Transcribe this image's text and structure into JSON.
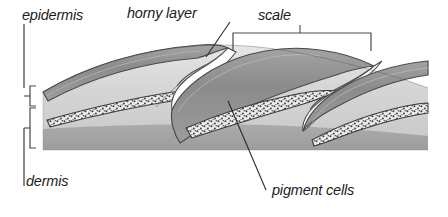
{
  "figure": {
    "width": 448,
    "height": 217
  },
  "labels": {
    "epidermis": "epidermis",
    "horny_layer": "horny layer",
    "scale": "scale",
    "dermis": "dermis",
    "pigment_cells": "pigment cells"
  },
  "colors": {
    "background": "#ffffff",
    "outline": "#3a3a3a",
    "leader_line": "#2b2b2b",
    "bracket": "#4a4a4a",
    "horny_layer_fill": "#8e8e8e",
    "horny_layer_dark": "#7a7a7a",
    "epidermis_fill": "#d2d2d2",
    "epidermis_light": "#e2e2e2",
    "dermis_fill": "#a8a8a8",
    "pigment_band_fill": "#e8e8e8",
    "pigment_speckle": "#3c3c3c",
    "gap_white": "#ffffff",
    "text": "#1b1b1b"
  },
  "structures": [
    {
      "name": "horny-layer",
      "description": "Dark keratinized outer band forming the upper surface of each scale",
      "label_ref": "horny_layer"
    },
    {
      "name": "epidermis",
      "description": "Light grey cellular layer beneath the horny layer, bracketed at left",
      "label_ref": "epidermis"
    },
    {
      "name": "dermis",
      "description": "Medium grey basal band at the bottom of the section",
      "label_ref": "dermis"
    },
    {
      "name": "pigment-cells",
      "description": "Speckled lens-shaped bands of pigment cells within each scale",
      "label_ref": "pigment_cells"
    },
    {
      "name": "scale",
      "description": "One complete overlapping scale unit spanned by the top bracket",
      "label_ref": "scale"
    }
  ],
  "annotations": {
    "brackets": [
      {
        "name": "epidermis-bracket",
        "orientation": "vertical-left",
        "spans": "epidermis"
      },
      {
        "name": "dermis-bracket",
        "orientation": "vertical-left",
        "spans": "dermis"
      },
      {
        "name": "scale-bracket",
        "orientation": "horizontal-top",
        "spans": "scale"
      }
    ],
    "leader_lines": [
      {
        "name": "horny-layer-leader",
        "from": "horny layer label",
        "to": "scale tip"
      },
      {
        "name": "pigment-cells-leader",
        "from": "pigment cells label",
        "to": "speckled band"
      },
      {
        "name": "epidermis-leader",
        "from": "epidermis label",
        "to": "epidermis bracket"
      },
      {
        "name": "dermis-leader",
        "from": "dermis label",
        "to": "dermis bracket"
      }
    ]
  }
}
